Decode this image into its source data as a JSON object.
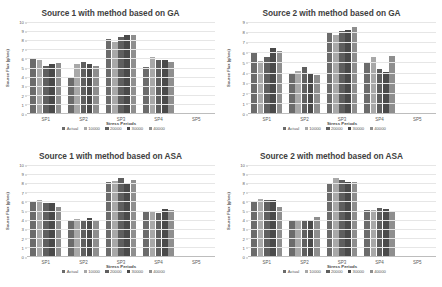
{
  "figure": {
    "series_colors": [
      "#6b6b6b",
      "#a8a8a8",
      "#5f5f5f",
      "#4a4a4a",
      "#8e8e8e"
    ],
    "legend_labels": [
      "Actual",
      "10000",
      "20000",
      "30000",
      "40000"
    ],
    "categories": [
      "SP1",
      "SP2",
      "SP3",
      "SP4",
      "SP5"
    ],
    "xlabel": "Stress Periods",
    "ylabel": "Source Flux (g/sec)"
  },
  "chart_data": [
    {
      "type": "bar",
      "title": "Source 1 with method based on GA",
      "xlabel": "Stress Periods",
      "ylabel": "Source Flux (g/sec)",
      "categories": [
        "SP1",
        "SP2",
        "SP3",
        "SP4",
        "SP5"
      ],
      "ylim": [
        0,
        10
      ],
      "yticks": [
        0,
        1,
        2,
        3,
        4,
        5,
        6,
        7,
        8,
        9,
        10
      ],
      "grid": true,
      "legend": [
        "Actual",
        "10000",
        "20000",
        "30000",
        "40000"
      ],
      "legend_position": "bottom",
      "series": [
        {
          "name": "Actual",
          "values": [
            6.0,
            4.0,
            8.1,
            5.1,
            0
          ]
        },
        {
          "name": "10000",
          "values": [
            5.8,
            5.4,
            7.8,
            6.2,
            0
          ]
        },
        {
          "name": "20000",
          "values": [
            5.2,
            5.6,
            8.4,
            5.8,
            0
          ]
        },
        {
          "name": "30000",
          "values": [
            5.4,
            5.4,
            8.6,
            5.8,
            0
          ]
        },
        {
          "name": "40000",
          "values": [
            5.5,
            5.2,
            8.6,
            5.6,
            0
          ]
        }
      ]
    },
    {
      "type": "bar",
      "title": "Source 2 with method based on GA",
      "xlabel": "Stress Periods",
      "ylabel": "Source Flux (g/sec)",
      "categories": [
        "SP1",
        "SP2",
        "SP3",
        "SP4",
        "SP5"
      ],
      "ylim": [
        0,
        9
      ],
      "yticks": [
        0,
        1,
        2,
        3,
        4,
        5,
        6,
        7,
        8,
        9
      ],
      "grid": true,
      "legend": [
        "Actual",
        "10000",
        "20000",
        "30000",
        "40000"
      ],
      "legend_position": "bottom",
      "series": [
        {
          "name": "Actual",
          "values": [
            5.9,
            4.0,
            8.0,
            5.0,
            0
          ]
        },
        {
          "name": "10000",
          "values": [
            5.1,
            4.2,
            7.7,
            5.5,
            0
          ]
        },
        {
          "name": "20000",
          "values": [
            5.5,
            4.6,
            8.1,
            4.4,
            0
          ]
        },
        {
          "name": "30000",
          "values": [
            6.4,
            4.0,
            8.2,
            4.1,
            0
          ]
        },
        {
          "name": "40000",
          "values": [
            6.1,
            3.8,
            8.5,
            5.6,
            0
          ]
        }
      ]
    },
    {
      "type": "bar",
      "title": "Source 1 with method based on ASA",
      "xlabel": "Stress Periods",
      "ylabel": "Source Flux (g/sec)",
      "categories": [
        "SP1",
        "SP2",
        "SP3",
        "SP4",
        "SP5"
      ],
      "ylim": [
        0,
        10
      ],
      "yticks": [
        0,
        1,
        2,
        3,
        4,
        5,
        6,
        7,
        8,
        9,
        10
      ],
      "grid": true,
      "legend": [
        "Actual",
        "10000",
        "20000",
        "30000",
        "40000"
      ],
      "legend_position": "bottom",
      "series": [
        {
          "name": "Actual",
          "values": [
            6.0,
            4.0,
            8.1,
            5.0,
            0
          ]
        },
        {
          "name": "10000",
          "values": [
            6.2,
            4.1,
            8.2,
            5.0,
            0
          ]
        },
        {
          "name": "20000",
          "values": [
            5.8,
            4.0,
            8.6,
            4.7,
            0
          ]
        },
        {
          "name": "30000",
          "values": [
            5.8,
            4.2,
            7.9,
            5.2,
            0
          ]
        },
        {
          "name": "40000",
          "values": [
            5.4,
            3.8,
            8.3,
            5.1,
            0
          ]
        }
      ]
    },
    {
      "type": "bar",
      "title": "Source 2 with method based on ASA",
      "xlabel": "Stress Periods",
      "ylabel": "Source Flux (g/sec)",
      "categories": [
        "SP1",
        "SP2",
        "SP3",
        "SP4",
        "SP5"
      ],
      "ylim": [
        0,
        10
      ],
      "yticks": [
        0,
        1,
        2,
        3,
        4,
        5,
        6,
        7,
        8,
        9,
        10
      ],
      "grid": true,
      "legend": [
        "Actual",
        "10000",
        "20000",
        "30000",
        "40000"
      ],
      "legend_position": "bottom",
      "series": [
        {
          "name": "Actual",
          "values": [
            6.0,
            4.0,
            8.0,
            5.1,
            0
          ]
        },
        {
          "name": "10000",
          "values": [
            6.3,
            3.9,
            8.6,
            5.1,
            0
          ]
        },
        {
          "name": "20000",
          "values": [
            6.2,
            3.8,
            8.4,
            5.3,
            0
          ]
        },
        {
          "name": "30000",
          "values": [
            6.2,
            3.9,
            8.1,
            5.2,
            0
          ]
        },
        {
          "name": "40000",
          "values": [
            5.4,
            4.3,
            8.1,
            4.8,
            0
          ]
        }
      ]
    }
  ]
}
